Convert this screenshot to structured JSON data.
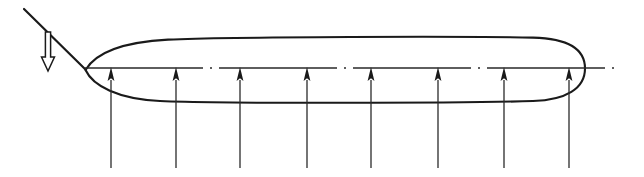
{
  "figure": {
    "background_color": "#ffffff",
    "line_color": "#1a1a1a",
    "width": 644,
    "height": 177
  },
  "body_outline": {
    "name": "airfoil-body",
    "description": "Closed lens-shaped wing section, sharp cusped leading edge at left, rounded cap at right",
    "leading_edge_point": [
      85,
      70
    ],
    "upper_surface_peak_y": 39,
    "lower_surface_trough_y": 101,
    "right_cap_x": 584,
    "stroke_width": 2.1
  },
  "centerline": {
    "name": "chord-centerline",
    "style": "dash-dot",
    "x_start": 85,
    "x_end": 616,
    "y": 68,
    "stroke_width": 1.3
  },
  "incident_line": {
    "name": "incoming-flow-line",
    "x1": 24,
    "y1": 9,
    "x2": 85,
    "y2": 70,
    "stroke_width": 2.2
  },
  "hollow_arrow": {
    "name": "downward-hollow-arrow",
    "direction": "down",
    "fill": "#ffffff",
    "stroke": "#1a1a1a",
    "shaft_x": 48,
    "shaft_top_y": 32,
    "shaft_bottom_y": 57,
    "shaft_half_width": 2.6,
    "head_half_width": 6.5,
    "tip_y": 71
  },
  "lift_arrows": {
    "name": "lift-pressure-arrows",
    "count": 8,
    "direction": "up",
    "tip_y": 67,
    "tail_y": 168,
    "head_height": 14,
    "head_half_width": 3.4,
    "shaft_width": 1.3,
    "x_positions": [
      111,
      176,
      240,
      307,
      371,
      438,
      504,
      569
    ]
  },
  "labels": []
}
